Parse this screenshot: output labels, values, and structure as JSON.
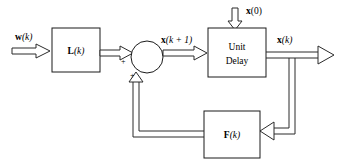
{
  "diagram": {
    "type": "block-diagram",
    "background_color": "#ffffff",
    "line_color": "#2b2b2b",
    "blocks": [
      {
        "id": "gain-l",
        "label_bold": "L",
        "label_rest": "(k)",
        "x": 52,
        "y": 28,
        "w": 48,
        "h": 44
      },
      {
        "id": "unit-delay",
        "line1": "Unit",
        "line2": "Delay",
        "x": 208,
        "y": 28,
        "w": 58,
        "h": 49
      },
      {
        "id": "gain-f",
        "label_bold": "F",
        "label_rest": "(k)",
        "x": 204,
        "y": 111,
        "w": 56,
        "h": 47
      }
    ],
    "summing_junction": {
      "id": "summer",
      "cx": 147,
      "cy": 57,
      "r": 16
    },
    "signals": {
      "input_w_bold": "w",
      "input_w_rest": "(k)",
      "state_next_bold": "x",
      "state_next_rest": "(k + 1)",
      "initial_state_bold": "x",
      "initial_state_rest": "(0)",
      "output_x_bold": "x",
      "output_x_rest": "(k)"
    },
    "sum_signs": [
      {
        "id": "plus-left",
        "text": "+",
        "x": 121,
        "y": 64
      },
      {
        "id": "plus-bottom",
        "text": "+",
        "x": 130,
        "y": 78
      }
    ]
  }
}
